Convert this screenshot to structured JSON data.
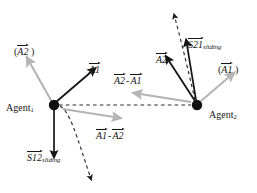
{
  "figure": {
    "background": "#ffffff",
    "width": 257,
    "height": 193,
    "colors": {
      "solid_black": "#151515",
      "gray_arrow": "#b4b4b4",
      "dashed_black": "#2a2a2a",
      "agent_dot": "#111111"
    }
  },
  "agents": [
    {
      "id": "agent1",
      "label": "Agent",
      "subscript": "1",
      "x": 54,
      "y": 105
    },
    {
      "id": "agent2",
      "label": "Agent",
      "subscript": "2",
      "x": 197,
      "y": 105
    }
  ],
  "labels": {
    "a2_paren_left": {
      "open": "(",
      "base": "A2",
      "close": " )"
    },
    "a1_left": {
      "base": "A1"
    },
    "s12_sliding": {
      "base": "S",
      "num": "12",
      "sub": "sliding"
    },
    "a1_minus_a2": {
      "left": "A1",
      "op": "-",
      "right": "A2"
    },
    "a2_minus_a1": {
      "left": "A2",
      "op": "-",
      "right": "A1"
    },
    "a2_right": {
      "base": "A2"
    },
    "s21_sliding": {
      "base": "S",
      "num": "21",
      "sub": "sliding"
    },
    "a1_paren_right": {
      "open": "(",
      "base": "A1",
      "close": " )"
    }
  },
  "vectors": [
    {
      "name": "a2-desired-left",
      "style": "gray",
      "from": [
        54,
        105
      ],
      "to": [
        27,
        58
      ]
    },
    {
      "name": "a1-actual-left",
      "style": "solid-black",
      "from": [
        54,
        105
      ],
      "to": [
        95,
        69
      ]
    },
    {
      "name": "s12-sliding",
      "style": "solid-black",
      "from": [
        54,
        105
      ],
      "to": [
        54,
        156
      ]
    },
    {
      "name": "a1-minus-a2-gray",
      "style": "gray",
      "from": [
        60,
        108
      ],
      "to": [
        118,
        118
      ]
    },
    {
      "name": "a1-minus-a2-dash",
      "style": "dashed-black",
      "from": [
        60,
        107
      ],
      "to": [
        96,
        185
      ]
    },
    {
      "name": "baseline-connector",
      "style": "dashed-black",
      "from": [
        58,
        105
      ],
      "to": [
        193,
        105
      ]
    },
    {
      "name": "a2-actual-right",
      "style": "solid-black",
      "from": [
        197,
        105
      ],
      "to": [
        166,
        57
      ]
    },
    {
      "name": "a2-minus-a1-gray",
      "style": "gray",
      "from": [
        193,
        103
      ],
      "to": [
        136,
        93
      ]
    },
    {
      "name": "s21-sliding",
      "style": "solid-black",
      "from": [
        197,
        105
      ],
      "to": [
        186,
        40
      ]
    },
    {
      "name": "a2-minus-a1-dash",
      "style": "dashed-black",
      "from": [
        196,
        103
      ],
      "to": [
        173,
        12
      ]
    },
    {
      "name": "a1-desired-right",
      "style": "gray",
      "from": [
        199,
        103
      ],
      "to": [
        233,
        74
      ]
    }
  ]
}
